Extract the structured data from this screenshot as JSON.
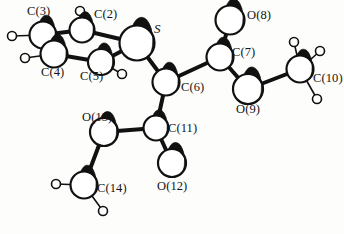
{
  "figure": {
    "kind": "molecular-structure-diagram",
    "style": "ball-and-stick ORTEP crystal structure drawing",
    "background_color": "#fdfdfb",
    "stroke_color": "#111111",
    "atom_fill": "#ffffff",
    "shading_color": "#111111",
    "width": 344,
    "height": 234
  },
  "atoms": [
    {
      "id": "C3",
      "label": "C(3)",
      "element": "C",
      "cx": 43,
      "cy": 35,
      "r": 13.5,
      "label_x": 27,
      "label_y": 5,
      "kind": "heavy"
    },
    {
      "id": "C2",
      "label": "C(2)",
      "element": "C",
      "cx": 82,
      "cy": 30,
      "r": 12.5,
      "label_x": 94,
      "label_y": 8,
      "kind": "heavy"
    },
    {
      "id": "S1",
      "label": "S",
      "element": "S",
      "cx": 137,
      "cy": 43,
      "r": 17.5,
      "label_x": 154,
      "label_y": 22,
      "kind": "heavy",
      "italic": true
    },
    {
      "id": "C4",
      "label": "C(4)",
      "element": "C",
      "cx": 54,
      "cy": 54,
      "r": 13.5,
      "label_x": 41,
      "label_y": 66,
      "kind": "heavy"
    },
    {
      "id": "C5",
      "label": "C(5)",
      "element": "C",
      "cx": 101,
      "cy": 62,
      "r": 13.0,
      "label_x": 80,
      "label_y": 70,
      "kind": "heavy"
    },
    {
      "id": "C6",
      "label": "C(6)",
      "element": "C",
      "cx": 166,
      "cy": 82,
      "r": 13.5,
      "label_x": 181,
      "label_y": 81,
      "kind": "heavy"
    },
    {
      "id": "O8",
      "label": "O(8)",
      "element": "O",
      "cx": 230,
      "cy": 20,
      "r": 14.5,
      "label_x": 247,
      "label_y": 9,
      "kind": "heavy"
    },
    {
      "id": "C7",
      "label": "C(7)",
      "element": "C",
      "cx": 220,
      "cy": 57,
      "r": 13.5,
      "label_x": 232,
      "label_y": 46,
      "kind": "heavy"
    },
    {
      "id": "O9",
      "label": "O(9)",
      "element": "O",
      "cx": 248,
      "cy": 89,
      "r": 15.0,
      "label_x": 236,
      "label_y": 103,
      "kind": "heavy"
    },
    {
      "id": "C10",
      "label": "C(10)",
      "element": "C",
      "cx": 300,
      "cy": 69,
      "r": 13.5,
      "label_x": 313,
      "label_y": 72,
      "kind": "heavy"
    },
    {
      "id": "O13",
      "label": "O(13)",
      "element": "O",
      "cx": 104,
      "cy": 132,
      "r": 14.0,
      "label_x": 82,
      "label_y": 111,
      "kind": "heavy"
    },
    {
      "id": "C11",
      "label": "C(11)",
      "element": "C",
      "cx": 156,
      "cy": 128,
      "r": 12.5,
      "label_x": 168,
      "label_y": 122,
      "kind": "heavy"
    },
    {
      "id": "O12",
      "label": "O(12)",
      "element": "O",
      "cx": 172,
      "cy": 163,
      "r": 14.0,
      "label_x": 157,
      "label_y": 180,
      "kind": "heavy"
    },
    {
      "id": "C14",
      "label": "C(14)",
      "element": "C",
      "cx": 84,
      "cy": 185,
      "r": 13.5,
      "label_x": 97,
      "label_y": 182,
      "kind": "heavy"
    }
  ],
  "hydrogens": [
    {
      "id": "H3",
      "cx": 12,
      "cy": 36,
      "r": 4.5,
      "bond_to": "C3"
    },
    {
      "id": "H2",
      "cx": 80,
      "cy": 11,
      "r": 4.5,
      "bond_to": "C2"
    },
    {
      "id": "H4",
      "cx": 25,
      "cy": 58,
      "r": 4.5,
      "bond_to": "C4"
    },
    {
      "id": "H5",
      "cx": 122,
      "cy": 74,
      "r": 4.5,
      "bond_to": "C5"
    },
    {
      "id": "H10a",
      "cx": 294,
      "cy": 42,
      "r": 4.5,
      "bond_to": "C10"
    },
    {
      "id": "H10b",
      "cx": 320,
      "cy": 51,
      "r": 4.5,
      "bond_to": "C10"
    },
    {
      "id": "H10c",
      "cx": 317,
      "cy": 99,
      "r": 4.5,
      "bond_to": "C10"
    },
    {
      "id": "H14a",
      "cx": 56,
      "cy": 184,
      "r": 4.5,
      "bond_to": "C14"
    },
    {
      "id": "H14b",
      "cx": 103,
      "cy": 211,
      "r": 4.5,
      "bond_to": "C14"
    }
  ],
  "bonds": [
    {
      "from": "C3",
      "to": "C2",
      "width": 4.0
    },
    {
      "from": "C3",
      "to": "C4",
      "width": 4.0
    },
    {
      "from": "C2",
      "to": "S1",
      "width": 4.0
    },
    {
      "from": "C4",
      "to": "C5",
      "width": 4.0
    },
    {
      "from": "C5",
      "to": "S1",
      "width": 4.0
    },
    {
      "from": "S1",
      "to": "C6",
      "width": 4.0
    },
    {
      "from": "C6",
      "to": "C7",
      "width": 4.0
    },
    {
      "from": "C6",
      "to": "C11",
      "width": 4.0
    },
    {
      "from": "C7",
      "to": "O8",
      "width": 4.0
    },
    {
      "from": "C7",
      "to": "O9",
      "width": 4.0
    },
    {
      "from": "O9",
      "to": "C10",
      "width": 4.0
    },
    {
      "from": "C11",
      "to": "O13",
      "width": 4.0
    },
    {
      "from": "C11",
      "to": "O12",
      "width": 4.0
    },
    {
      "from": "O13",
      "to": "C14",
      "width": 4.0
    }
  ],
  "labels": {
    "C3": "C(3)",
    "C2": "C(2)",
    "S1": "S",
    "C4": "C(4)",
    "C5": "C(5)",
    "C6": "C(6)",
    "O8": "O(8)",
    "C7": "C(7)",
    "O9": "O(9)",
    "C10": "C(10)",
    "O13": "O(13)",
    "C11": "C(11)",
    "O12": "O(12)",
    "C14": "C(14)"
  }
}
